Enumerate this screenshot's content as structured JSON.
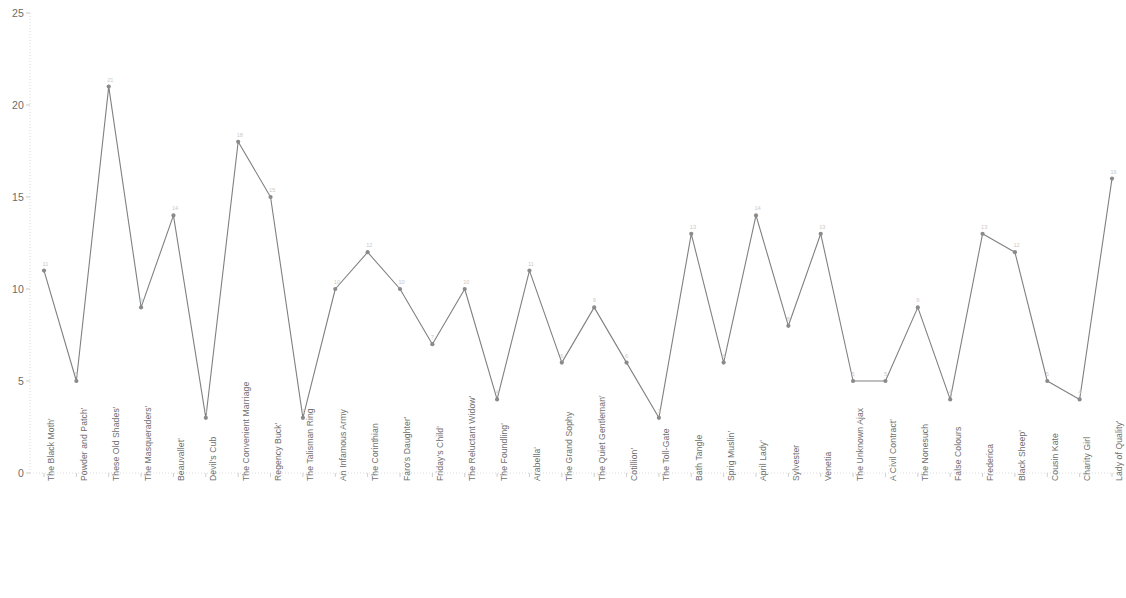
{
  "chart_data": {
    "type": "line",
    "title": "",
    "subtitle": "",
    "xlabel": "",
    "ylabel": "",
    "ylim": [
      0,
      25
    ],
    "yticks": [
      0,
      5,
      10,
      15,
      20,
      25
    ],
    "grid": false,
    "legend": "none",
    "series_color": "#808080",
    "marker_color": "#8a8a8a",
    "show_value_labels": true,
    "categories": [
      "The Black Moth'",
      "Powder and Patch'",
      "These Old Shades'",
      "The Masqueraders'",
      "Beauvallet'",
      "Devil's Cub",
      "The Convenient Marriage",
      "Regency Buck'",
      "The Talisman Ring",
      "An Infamous Army",
      "The Corinthian",
      "Faro's Daughter'",
      "Friday's Child'",
      "The Reluctant Widow'",
      "The Foundling'",
      "Arabella'",
      "The Grand Sophy",
      "The Quiet Gentleman'",
      "Cotillion'",
      "The Toll-Gate",
      "Bath Tangle",
      "Sprig Muslin'",
      "April Lady'",
      "Sylvester",
      "Venetia",
      "The Unknown Ajax",
      "A Civil Contract'",
      "The Nonesuch",
      "False Colours",
      "Frederica",
      "Black Sheep'",
      "Cousin Kate",
      "Charity Girl",
      "Lady of Quality'"
    ],
    "values": [
      11,
      5,
      21,
      9,
      14,
      3,
      18,
      15,
      3,
      10,
      12,
      10,
      7,
      10,
      4,
      11,
      6,
      9,
      6,
      3,
      13,
      6,
      14,
      8,
      13,
      5,
      5,
      9,
      4,
      13,
      12,
      5,
      4,
      16
    ]
  },
  "axes": {
    "y_tick_labels": [
      "0",
      "5",
      "10",
      "15",
      "20",
      "25"
    ]
  }
}
